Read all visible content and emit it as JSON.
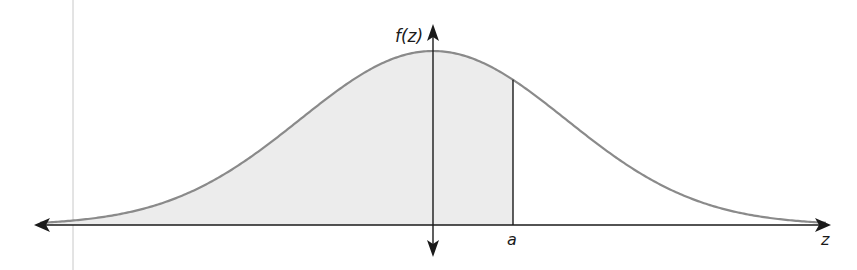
{
  "figure": {
    "y_axis_label": "f(z)",
    "x_axis_label": "z",
    "marker_label": "a",
    "colors": {
      "curve": "#8a8a8a",
      "fill": "#ececec",
      "axis": "#1a1a1a",
      "margin_line": "#c8c8c8"
    }
  },
  "chart_data": {
    "type": "area",
    "title": "",
    "xlabel": "z",
    "ylabel": "f(z)",
    "distribution": "normal",
    "mean": 0,
    "sd": 1,
    "shaded_region": "z < a",
    "a_approx": 0.6,
    "x_range": [
      -3.0,
      3.0
    ],
    "grid": false,
    "legend": null,
    "annotations": [
      "f(z)",
      "a",
      "z"
    ]
  }
}
